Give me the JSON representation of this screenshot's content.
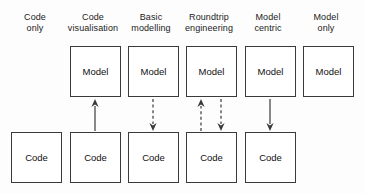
{
  "diagram": {
    "background_color": "#fdfdfd",
    "stroke_color": "#3a3a3a",
    "text_color": "#101010",
    "columns": [
      {
        "id": "code-only",
        "header_line1": "Code",
        "header_line2": "only",
        "header_x": 2,
        "model_box": null,
        "code_box": {
          "label": "Code",
          "x": 11,
          "y": 132
        },
        "arrows": []
      },
      {
        "id": "code-visualisation",
        "header_line1": "Code",
        "header_line2": "visualisation",
        "header_x": 60,
        "model_box": {
          "label": "Model",
          "x": 70,
          "y": 46
        },
        "code_box": {
          "label": "Code",
          "x": 70,
          "y": 132
        },
        "arrows": [
          {
            "name": "arrow-up-solid",
            "style": "solid",
            "direction": "up",
            "x": 95,
            "y_from": 131,
            "y_to": 99
          }
        ]
      },
      {
        "id": "basic-modelling",
        "header_line1": "Basic",
        "header_line2": "modelling",
        "header_x": 118,
        "model_box": {
          "label": "Model",
          "x": 128,
          "y": 46
        },
        "code_box": {
          "label": "Code",
          "x": 128,
          "y": 132
        },
        "arrows": [
          {
            "name": "arrow-down-dashed",
            "style": "dashed",
            "direction": "down",
            "x": 153,
            "y_from": 99,
            "y_to": 131
          }
        ]
      },
      {
        "id": "roundtrip-engineering",
        "header_line1": "Roundtrip",
        "header_line2": "engineering",
        "header_x": 176,
        "model_box": {
          "label": "Model",
          "x": 186,
          "y": 46
        },
        "code_box": {
          "label": "Code",
          "x": 186,
          "y": 132
        },
        "arrows": [
          {
            "name": "arrow-up-dashed",
            "style": "dashed",
            "direction": "up",
            "x": 201,
            "y_from": 131,
            "y_to": 99
          },
          {
            "name": "arrow-down-dashed",
            "style": "dashed",
            "direction": "down",
            "x": 221,
            "y_from": 99,
            "y_to": 131
          }
        ]
      },
      {
        "id": "model-centric",
        "header_line1": "Model",
        "header_line2": "centric",
        "header_x": 235,
        "model_box": {
          "label": "Model",
          "x": 245,
          "y": 46
        },
        "code_box": {
          "label": "Code",
          "x": 245,
          "y": 132
        },
        "arrows": [
          {
            "name": "arrow-down-solid",
            "style": "solid",
            "direction": "down",
            "x": 270,
            "y_from": 99,
            "y_to": 131
          }
        ]
      },
      {
        "id": "model-only",
        "header_line1": "Model",
        "header_line2": "only",
        "header_x": 293,
        "model_box": {
          "label": "Model",
          "x": 303,
          "y": 46
        },
        "code_box": null,
        "arrows": []
      }
    ]
  }
}
